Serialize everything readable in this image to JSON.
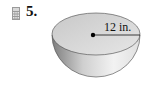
{
  "problem": {
    "number": "5.",
    "icon": "calculator-icon"
  },
  "figure": {
    "shape": "hemisphere",
    "radius_label": "12 in.",
    "colors": {
      "bowl_light": "#e8e8e8",
      "bowl_dark": "#8a8a8a",
      "top_face": "#d4d4d4",
      "outline": "#333333"
    }
  }
}
